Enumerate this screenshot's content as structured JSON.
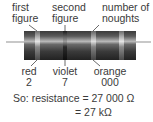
{
  "top_labels": {
    "first": {
      "line1": "first",
      "line2": "figure"
    },
    "second": {
      "line1": "second",
      "line2": "figure"
    },
    "third": {
      "line1": "number of",
      "line2": "noughts"
    }
  },
  "bands": [
    {
      "color_name": "red",
      "digit": "2",
      "x": 37
    },
    {
      "color_name": "violet",
      "digit": "7",
      "x": 65
    },
    {
      "color_name": "orange",
      "digit": "000",
      "x": 93
    },
    {
      "color_name": "tolerance",
      "digit": "",
      "x": 121
    }
  ],
  "bottom_labels": {
    "first": {
      "color": "red",
      "value": "2"
    },
    "second": {
      "color": "violet",
      "value": "7"
    },
    "third": {
      "color": "orange",
      "value": "000"
    }
  },
  "result": {
    "line1": "So: resistance = 27 000 Ω",
    "line2": "= 27 kΩ"
  },
  "colors": {
    "body_dark": "#2b2b2b",
    "body_mid": "#5a5a5a",
    "highlight": "#bdbdbd",
    "band_light": "#d8d8d8",
    "wire": "#c8c8c8"
  }
}
